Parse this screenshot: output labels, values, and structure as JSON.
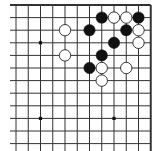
{
  "board": {
    "view": "top-right corner of 19x19 Go board",
    "grid": {
      "cols": 12,
      "rows": 12,
      "x0": 16,
      "dx": 12.25,
      "y0": 5,
      "dy": 12.6,
      "left_start": 10,
      "has_top_border": true,
      "has_right_border": true
    },
    "colors": {
      "background": "#ffffff",
      "line": "#333333",
      "black_stone": "#111111",
      "white_stone": "#ffffff",
      "white_stone_border": "#222222"
    },
    "star_points": [
      {
        "col": 2,
        "row": 3
      },
      {
        "col": 2,
        "row": 9
      },
      {
        "col": 8,
        "row": 9
      }
    ],
    "stones": [
      {
        "color": "black",
        "col": 7,
        "row": 1
      },
      {
        "color": "white",
        "col": 8,
        "row": 1
      },
      {
        "color": "white",
        "col": 9,
        "row": 1
      },
      {
        "color": "black",
        "col": 10,
        "row": 1
      },
      {
        "color": "white",
        "col": 4,
        "row": 2
      },
      {
        "color": "black",
        "col": 6,
        "row": 2
      },
      {
        "color": "black",
        "col": 9,
        "row": 2
      },
      {
        "color": "white",
        "col": 10,
        "row": 2
      },
      {
        "color": "black",
        "col": 8,
        "row": 3
      },
      {
        "color": "white",
        "col": 10,
        "row": 3
      },
      {
        "color": "white",
        "col": 4,
        "row": 4
      },
      {
        "color": "black",
        "col": 7,
        "row": 4
      },
      {
        "color": "black",
        "col": 6,
        "row": 5
      },
      {
        "color": "white",
        "col": 7,
        "row": 5
      },
      {
        "color": "white",
        "col": 9,
        "row": 5
      },
      {
        "color": "white",
        "col": 7,
        "row": 6
      }
    ]
  }
}
